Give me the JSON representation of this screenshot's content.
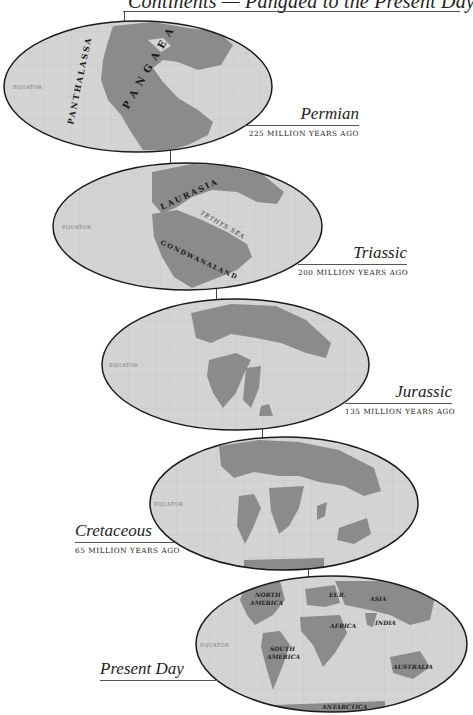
{
  "title": "Continents — Pangaea to the Present Day",
  "colors": {
    "background": "#ffffff",
    "ocean": "#d4d4d4",
    "land": "#8b8b8b",
    "grid": "#bdbdbd",
    "outline": "#1a1a1a",
    "rule": "#555555"
  },
  "equator_label": "EQUATOR",
  "maps": [
    {
      "era": "Permian",
      "age": "225 million years ago",
      "labels": [
        "PANTHALASSA",
        "PANGAEA"
      ]
    },
    {
      "era": "Triassic",
      "age": "200 million years ago",
      "labels": [
        "LAURASIA",
        "TETHYS SEA",
        "GONDWANALAND"
      ]
    },
    {
      "era": "Jurassic",
      "age": "135 million years ago",
      "labels": []
    },
    {
      "era": "Cretaceous",
      "age": "65 million years ago",
      "labels": []
    },
    {
      "era": "Present Day",
      "age": "",
      "labels": [
        "NORTH",
        "AMERICA",
        "EUR.",
        "ASIA",
        "AFRICA",
        "INDIA",
        "SOUTH",
        "AMERICA",
        "AUSTRALIA",
        "ANTARCTICA"
      ]
    }
  ]
}
